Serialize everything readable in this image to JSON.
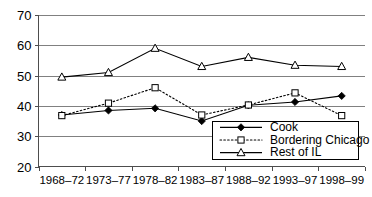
{
  "chart_data": {
    "type": "line",
    "title": "",
    "xlabel": "",
    "ylabel": "",
    "categories": [
      "1968–72",
      "1973–77",
      "1978–82",
      "1983–87",
      "1988–92",
      "1993–97",
      "1998–99"
    ],
    "ylim": [
      20,
      70
    ],
    "yticks": [
      20,
      30,
      40,
      50,
      60,
      70
    ],
    "grid": true,
    "legend_position": "bottom-right",
    "series": [
      {
        "name": "Cook",
        "marker": "filled-diamond",
        "line_style": "solid",
        "color": "#000000",
        "values": [
          37.0,
          38.5,
          39.2,
          35.0,
          40.2,
          41.3,
          43.3
        ]
      },
      {
        "name": "Bordering Chicago",
        "marker": "open-square",
        "line_style": "dotted",
        "color": "#000000",
        "values": [
          36.8,
          40.9,
          46.0,
          37.0,
          40.3,
          44.3,
          36.8
        ]
      },
      {
        "name": "Rest of IL",
        "marker": "open-triangle",
        "line_style": "solid",
        "color": "#000000",
        "values": [
          49.5,
          51.0,
          59.0,
          53.0,
          56.0,
          53.4,
          53.0
        ]
      }
    ]
  },
  "axes": {
    "y_tick_labels": [
      "70",
      "60",
      "50",
      "40",
      "30",
      "20"
    ],
    "x_tick_labels": [
      "1968–72",
      "1973–77",
      "1978–82",
      "1983–87",
      "1988–92",
      "1993–97",
      "1998–99"
    ]
  },
  "legend": {
    "entries": [
      {
        "label": "Cook",
        "icon": "filled-diamond-icon"
      },
      {
        "label": "Bordering Chicago",
        "icon": "open-square-icon"
      },
      {
        "label": "Rest of IL",
        "icon": "open-triangle-icon"
      }
    ]
  }
}
